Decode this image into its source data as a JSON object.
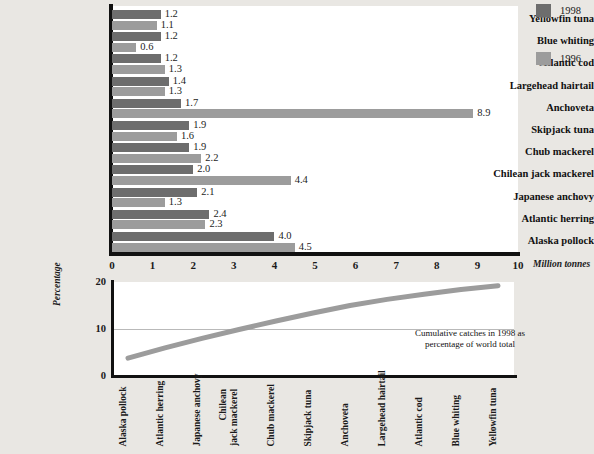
{
  "chart_data": [
    {
      "type": "bar",
      "orientation": "horizontal",
      "title": "",
      "xlabel": "Million tonnes",
      "ylabel": "",
      "xlim": [
        0,
        10
      ],
      "xticks": [
        "0",
        "1",
        "2",
        "3",
        "4",
        "5",
        "6",
        "7",
        "8",
        "9",
        "10"
      ],
      "grid": false,
      "legend_position": "right",
      "categories": [
        "Yellowfin tuna",
        "Blue whiting",
        "Atlantic cod",
        "Largehead hairtail",
        "Anchoveta",
        "Skipjack tuna",
        "Chub mackerel",
        "Chilean jack mackerel",
        "Japanese anchovy",
        "Atlantic herring",
        "Alaska pollock"
      ],
      "series": [
        {
          "name": "1998",
          "color": "#6d6d6d",
          "values": [
            1.2,
            1.2,
            1.2,
            1.4,
            1.7,
            1.9,
            1.9,
            2.0,
            2.1,
            2.4,
            4.0
          ],
          "labels": [
            "1.2",
            "1.2",
            "1.2",
            "1.4",
            "1.7",
            "1.9",
            "1.9",
            "2.0",
            "2.1",
            "2.4",
            "4.0"
          ]
        },
        {
          "name": "1996",
          "color": "#9c9c9c",
          "values": [
            1.1,
            0.6,
            1.3,
            1.3,
            8.9,
            1.6,
            2.2,
            4.4,
            1.3,
            2.3,
            4.5
          ],
          "labels": [
            "1.1",
            "0.6",
            "1.3",
            "1.3",
            "8.9",
            "1.6",
            "2.2",
            "4.4",
            "1.3",
            "2.3",
            "4.5"
          ]
        }
      ]
    },
    {
      "type": "line",
      "title": "",
      "annotation": "Cumulative catches in 1998 as\npercentage of world total",
      "annotation_line1": "Cumulative catches in 1998 as",
      "annotation_line2": "percentage of world total",
      "xlabel": "",
      "ylabel": "Percentage",
      "ylim": [
        0,
        20
      ],
      "yticks": [
        "0",
        "10",
        "20"
      ],
      "grid": true,
      "line_color": "#9c9c9c",
      "categories": [
        "Alaska pollock",
        "Atlantic herring",
        "Japanese anchovy",
        "Chilean\njack mackerel",
        "Chub mackerel",
        "Skipjack tuna",
        "Anchoveta",
        "Largehead hairtail",
        "Atlantic cod",
        "Blue whiting",
        "Yellowfin tuna"
      ],
      "values": [
        3.8,
        6.0,
        8.0,
        9.9,
        11.7,
        13.4,
        15.0,
        16.3,
        17.4,
        18.4,
        19.2
      ]
    }
  ],
  "legend": {
    "items": [
      {
        "label": "1998",
        "color": "#6d6d6d"
      },
      {
        "label": "1996",
        "color": "#9c9c9c"
      }
    ]
  }
}
